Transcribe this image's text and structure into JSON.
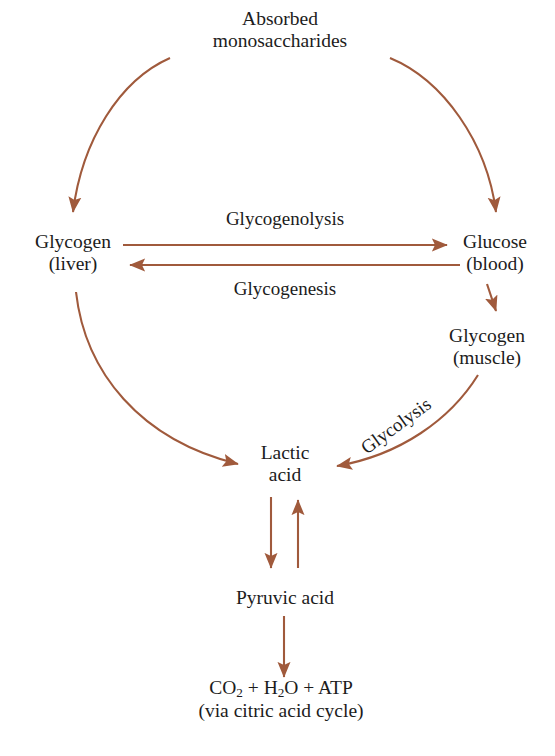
{
  "diagram": {
    "arrow_color": "#a05a3c",
    "text_color": "#1c1c1c",
    "background": "#ffffff",
    "nodes": [
      {
        "id": "absorbed",
        "line1": "Absorbed",
        "line2": "monosaccharides",
        "x": 280,
        "y": 30
      },
      {
        "id": "glycogen-liver",
        "line1": "Glycogen",
        "line2": "(liver)",
        "x": 73,
        "y": 253
      },
      {
        "id": "glucose-blood",
        "line1": "Glucose",
        "line2": "(blood)",
        "x": 495,
        "y": 253
      },
      {
        "id": "glycogen-muscle",
        "line1": "Glycogen",
        "line2": "(muscle)",
        "x": 487,
        "y": 347
      },
      {
        "id": "lactic-acid",
        "line1": "Lactic",
        "line2": "acid",
        "x": 285,
        "y": 464
      },
      {
        "id": "pyruvic-acid",
        "line1": "Pyruvic acid",
        "line2": "",
        "x": 285,
        "y": 598
      }
    ],
    "edge_labels": [
      {
        "id": "glycogenolysis",
        "text": "Glycogenolysis",
        "x": 285,
        "y": 219,
        "rotated": false
      },
      {
        "id": "glycogenesis",
        "text": "Glycogenesis",
        "x": 285,
        "y": 289,
        "rotated": false
      },
      {
        "id": "glycolysis",
        "text": "Glycolysis",
        "x": 396,
        "y": 426,
        "rotated": true
      }
    ],
    "formula": {
      "id": "end-products",
      "part1": "CO",
      "sub1": "2",
      "part2": " + H",
      "sub2": "2",
      "part3": "O + ATP",
      "line2": "(via citric acid cycle)",
      "x": 281,
      "y": 700
    }
  }
}
